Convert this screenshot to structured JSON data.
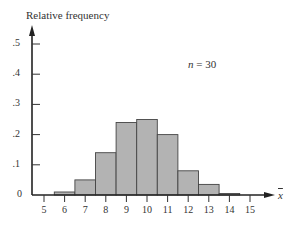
{
  "chart_data": {
    "type": "bar",
    "title": "",
    "xlabel": "x̄",
    "ylabel": "Relative frequency",
    "annotation": "n = 30",
    "categories": [
      "5",
      "6",
      "7",
      "8",
      "9",
      "10",
      "11",
      "12",
      "13",
      "14",
      "15"
    ],
    "values": [
      0,
      0.01,
      0.05,
      0.14,
      0.24,
      0.25,
      0.2,
      0.08,
      0.035,
      0.005,
      0
    ],
    "x_ticks": [
      "5",
      "6",
      "7",
      "8",
      "9",
      "10",
      "11",
      "12",
      "13",
      "14",
      "15"
    ],
    "y_ticks": [
      "0",
      ".1",
      ".2",
      ".3",
      ".4",
      ".5"
    ],
    "ylim": [
      0,
      0.55
    ],
    "xlim": [
      4.5,
      16
    ],
    "grid": false,
    "legend": null,
    "bar_color": "#b3b3b3",
    "edge_color": "#444444"
  },
  "labels": {
    "ylabel": "Relative frequency",
    "n_italic": "n",
    "n_rest": " = 30",
    "xvar": "x"
  }
}
